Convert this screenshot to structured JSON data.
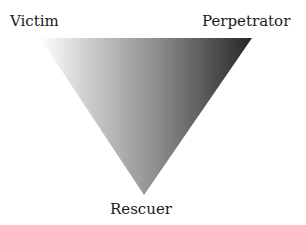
{
  "diagram": {
    "title": "",
    "type": "drama-triangle",
    "shape": "inverted-triangle",
    "gradient": {
      "direction": "left-to-right",
      "start_color": "#ffffff",
      "mid_color": "#a8a8a8",
      "end_color": "#2a2a2a"
    },
    "vertices": {
      "top_left": {
        "label": "Victim"
      },
      "top_right": {
        "label": "Perpetrator"
      },
      "bottom": {
        "label": "Rescuer"
      }
    }
  }
}
